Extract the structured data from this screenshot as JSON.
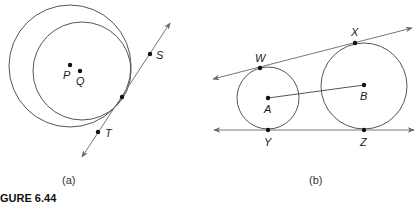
{
  "figure": {
    "caption": "GURE 6.44",
    "panel_a": {
      "label": "(a)",
      "points": {
        "P": "P",
        "Q": "Q",
        "S": "S",
        "T": "T"
      }
    },
    "panel_b": {
      "label": "(b)",
      "points": {
        "W": "W",
        "X": "X",
        "A": "A",
        "B": "B",
        "Y": "Y",
        "Z": "Z"
      }
    },
    "colors": {
      "stroke": "#555555",
      "line": "#777777",
      "point": "#111111"
    }
  }
}
